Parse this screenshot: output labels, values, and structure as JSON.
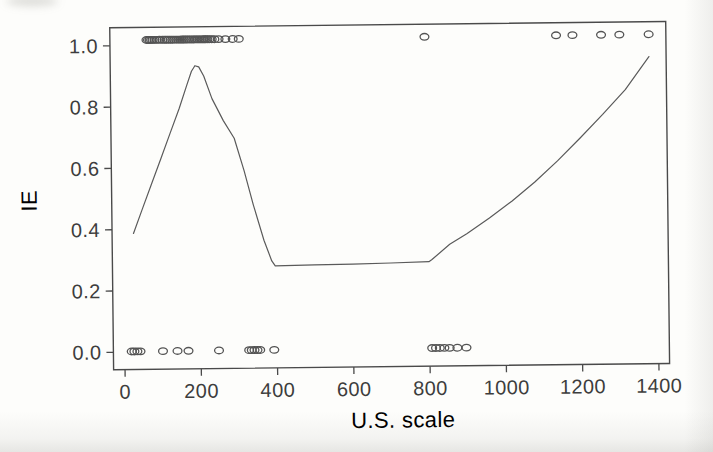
{
  "figure": {
    "background": "#fdfdfb",
    "frame_color": "#4a4a4a",
    "curve_color": "#5a5a5a",
    "marker_color": "#545454",
    "text_color": "#3d3d3d"
  },
  "chart_data": {
    "type": "scatter",
    "title": "",
    "xlabel": "U.S. scale",
    "ylabel": "IE",
    "grid": false,
    "legend": "none",
    "xlim": [
      -30,
      1428
    ],
    "ylim": [
      -0.057,
      1.059
    ],
    "x_ticks": {
      "values": [
        0,
        200,
        400,
        600,
        800,
        1000,
        1200,
        1400
      ],
      "labels": [
        "0",
        "200",
        "400",
        "600",
        "800",
        "1000",
        "1200",
        "1400"
      ]
    },
    "y_ticks": {
      "values": [
        0,
        0.2,
        0.4,
        0.6,
        0.8,
        1
      ],
      "labels": [
        "0.0",
        "0.2",
        "0.4",
        "0.6",
        "0.8",
        "1.0"
      ]
    },
    "series": [
      {
        "name": "IE = 1 observations",
        "type": "scatter",
        "marker": "open-circle",
        "y": 1.018,
        "x": [
          66,
          70,
          74,
          78,
          82,
          87,
          93,
          100,
          108,
          114,
          119,
          124,
          129,
          134,
          139,
          144,
          149,
          154,
          159,
          164,
          169,
          174,
          179,
          184,
          189,
          193,
          197,
          201,
          205,
          209,
          213,
          217,
          221,
          226,
          231,
          237,
          244,
          255,
          273,
          292,
          308,
          795,
          1140,
          1183,
          1258,
          1306,
          1383
        ]
      },
      {
        "name": "IE = 0 observations",
        "type": "scatter",
        "marker": "open-circle",
        "y": 0.002,
        "x": [
          18,
          25,
          33,
          41,
          100,
          138,
          167,
          247,
          326,
          333,
          340,
          348,
          355,
          392,
          806,
          816,
          826,
          838,
          852,
          872,
          896
        ]
      },
      {
        "name": "fitted curve",
        "type": "line",
        "points": [
          [
            26,
            0.387
          ],
          [
            50,
            0.466
          ],
          [
            75,
            0.548
          ],
          [
            100,
            0.63
          ],
          [
            125,
            0.712
          ],
          [
            150,
            0.794
          ],
          [
            170,
            0.868
          ],
          [
            183,
            0.914
          ],
          [
            192,
            0.932
          ],
          [
            202,
            0.928
          ],
          [
            215,
            0.898
          ],
          [
            236,
            0.824
          ],
          [
            265,
            0.752
          ],
          [
            293,
            0.694
          ],
          [
            318,
            0.588
          ],
          [
            341,
            0.477
          ],
          [
            368,
            0.36
          ],
          [
            388,
            0.292
          ],
          [
            397,
            0.276
          ],
          [
            500,
            0.278
          ],
          [
            600,
            0.279
          ],
          [
            700,
            0.281
          ],
          [
            800,
            0.284
          ],
          [
            808,
            0.291
          ],
          [
            855,
            0.34
          ],
          [
            900,
            0.374
          ],
          [
            960,
            0.424
          ],
          [
            1020,
            0.479
          ],
          [
            1080,
            0.54
          ],
          [
            1140,
            0.608
          ],
          [
            1200,
            0.682
          ],
          [
            1260,
            0.758
          ],
          [
            1320,
            0.838
          ],
          [
            1383,
            0.945
          ]
        ]
      }
    ]
  }
}
